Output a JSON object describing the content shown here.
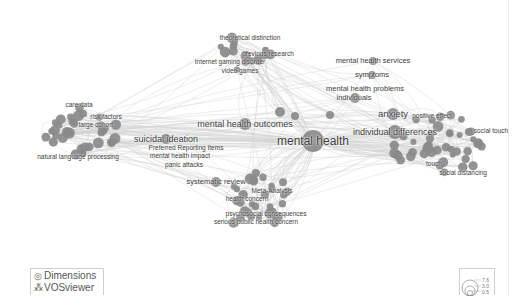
{
  "map": {
    "type": "co-occurrence network",
    "node_color": "#8a8a8a",
    "edge_color": "#d2d2d2",
    "label_color": "#3c3c3c",
    "labels": [
      {
        "text": "mental health",
        "x": 313,
        "y": 141,
        "size": 12
      },
      {
        "text": "mental health outcomes",
        "x": 245,
        "y": 124,
        "size": 9
      },
      {
        "text": "suicidal ideation",
        "x": 166,
        "y": 139,
        "size": 9
      },
      {
        "text": "Preferred Reporting Items",
        "x": 186,
        "y": 148,
        "size": 6.5
      },
      {
        "text": "mental health impact",
        "x": 180,
        "y": 156,
        "size": 6.5
      },
      {
        "text": "panic attacks",
        "x": 184,
        "y": 165,
        "size": 6.5
      },
      {
        "text": "systematic review",
        "x": 216,
        "y": 182,
        "size": 7.5
      },
      {
        "text": "Meta-Analysis",
        "x": 272,
        "y": 191,
        "size": 6.5
      },
      {
        "text": "health concern",
        "x": 247,
        "y": 199,
        "size": 6.5
      },
      {
        "text": "psychosocial consequences",
        "x": 266,
        "y": 214,
        "size": 6.5
      },
      {
        "text": "serious public health concern",
        "x": 256,
        "y": 222,
        "size": 6.5
      },
      {
        "text": "theoretical distinction",
        "x": 250,
        "y": 38,
        "size": 6.5
      },
      {
        "text": "previous research",
        "x": 268,
        "y": 54,
        "size": 6.5
      },
      {
        "text": "Internet gaming disorder",
        "x": 230,
        "y": 62,
        "size": 6.5
      },
      {
        "text": "video games",
        "x": 240,
        "y": 71,
        "size": 6.5
      },
      {
        "text": "mental health services",
        "x": 373,
        "y": 61,
        "size": 7.5
      },
      {
        "text": "symptoms",
        "x": 372,
        "y": 75,
        "size": 7.5
      },
      {
        "text": "mental health problems",
        "x": 365,
        "y": 89,
        "size": 7.5
      },
      {
        "text": "individuals",
        "x": 354,
        "y": 98,
        "size": 7.5
      },
      {
        "text": "anxiety",
        "x": 393,
        "y": 114,
        "size": 9.5
      },
      {
        "text": "positive effect",
        "x": 432,
        "y": 116,
        "size": 6.5
      },
      {
        "text": "individual differences",
        "x": 395,
        "y": 132,
        "size": 9
      },
      {
        "text": "social touch",
        "x": 491,
        "y": 131,
        "size": 6.5
      },
      {
        "text": "touch",
        "x": 434,
        "y": 164,
        "size": 6.5
      },
      {
        "text": "social distancing",
        "x": 463,
        "y": 173,
        "size": 6.5
      },
      {
        "text": "care data",
        "x": 79,
        "y": 105,
        "size": 6.5
      },
      {
        "text": "risk factors",
        "x": 106,
        "y": 117,
        "size": 6.5
      },
      {
        "text": "large cohort",
        "x": 96,
        "y": 125,
        "size": 6.5
      },
      {
        "text": "natural language processing",
        "x": 78,
        "y": 157,
        "size": 6.5
      }
    ]
  },
  "branding": {
    "line1": "Dimensions",
    "line2": "VOSviewer",
    "icon1": "dimensions-logo-icon",
    "icon2": "vosviewer-logo-icon"
  },
  "legend": {
    "values": [
      "7.6",
      "3.0",
      "0.5"
    ]
  }
}
